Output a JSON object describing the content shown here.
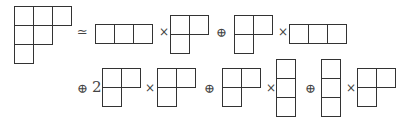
{
  "diagram": {
    "lhs": {
      "shape": [
        3,
        2,
        1
      ]
    },
    "relation_symbol": "≃",
    "times_symbol": "×",
    "plus_symbol": "⊕",
    "coefficient": "2",
    "terms": [
      {
        "coef": "",
        "left": [
          3
        ],
        "right": [
          2,
          1
        ]
      },
      {
        "coef": "",
        "left": [
          2,
          1
        ],
        "right": [
          3
        ]
      },
      {
        "coef": "2",
        "left": [
          2,
          1
        ],
        "right": [
          2,
          1
        ]
      },
      {
        "coef": "",
        "left": [
          2,
          1
        ],
        "right": [
          1,
          1,
          1
        ]
      },
      {
        "coef": "",
        "left": [
          1,
          1,
          1
        ],
        "right": [
          2,
          1
        ]
      }
    ]
  }
}
